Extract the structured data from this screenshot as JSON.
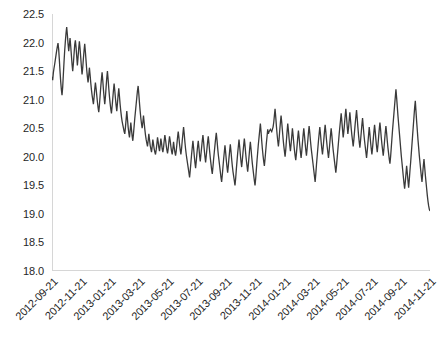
{
  "chart_data": {
    "type": "line",
    "title": "",
    "subtitle": "",
    "xlabel": "",
    "ylabel": "",
    "grid": false,
    "legend": false,
    "legend_position": "none",
    "line_color": "#3a3a3a",
    "axis_color": "#d6d6d6",
    "text_color": "#262626",
    "background": "#ffffff",
    "ylim": [
      18.0,
      22.5
    ],
    "y_ticks": [
      "18.0",
      "18.5",
      "19.0",
      "19.5",
      "20.0",
      "20.5",
      "21.0",
      "21.5",
      "22.0",
      "22.5"
    ],
    "y_tick_values": [
      18.0,
      18.5,
      19.0,
      19.5,
      20.0,
      20.5,
      21.0,
      21.5,
      22.0,
      22.5
    ],
    "x_tick_labels": [
      "2012-09-21",
      "2012-11-21",
      "2013-01-21",
      "2013-03-21",
      "2013-05-21",
      "2013-07-21",
      "2013-09-21",
      "2013-11-21",
      "2014-01-21",
      "2014-03-21",
      "2014-05-21",
      "2014-07-21",
      "2014-09-21",
      "2014-11-21"
    ],
    "x_range": [
      "2012-09-21",
      "2014-11-21"
    ],
    "series": [
      {
        "name": "series-1",
        "color": "#3a3a3a",
        "values": [
          21.4,
          21.34,
          21.47,
          21.55,
          21.62,
          21.7,
          21.78,
          21.86,
          21.93,
          21.99,
          21.88,
          21.7,
          21.5,
          21.32,
          21.18,
          21.08,
          21.22,
          21.44,
          21.66,
          21.86,
          22.02,
          22.16,
          22.27,
          22.14,
          21.98,
          21.85,
          21.96,
          22.08,
          21.94,
          21.78,
          21.62,
          21.5,
          21.63,
          21.8,
          21.96,
          22.04,
          21.92,
          21.76,
          21.6,
          21.74,
          21.9,
          22.02,
          21.9,
          21.74,
          21.58,
          21.44,
          21.56,
          21.72,
          21.86,
          21.98,
          21.84,
          21.68,
          21.52,
          21.4,
          21.3,
          21.42,
          21.56,
          21.44,
          21.3,
          21.18,
          21.08,
          21.0,
          20.92,
          21.04,
          21.18,
          21.3,
          21.2,
          21.08,
          20.96,
          20.86,
          20.78,
          20.9,
          21.06,
          21.22,
          21.36,
          21.48,
          21.34,
          21.18,
          21.04,
          20.92,
          21.05,
          21.22,
          21.38,
          21.5,
          21.36,
          21.2,
          21.06,
          20.94,
          20.84,
          20.76,
          20.88,
          21.02,
          21.16,
          21.28,
          21.16,
          21.02,
          20.9,
          20.8,
          20.94,
          21.08,
          21.2,
          21.06,
          20.92,
          20.8,
          20.7,
          20.62,
          20.56,
          20.5,
          20.44,
          20.4,
          20.52,
          20.66,
          20.8,
          20.66,
          20.52,
          20.42,
          20.34,
          20.46,
          20.6,
          20.48,
          20.36,
          20.28,
          20.4,
          20.54,
          20.68,
          20.8,
          20.92,
          21.04,
          21.16,
          21.24,
          21.1,
          20.94,
          20.8,
          20.68,
          20.58,
          20.5,
          20.6,
          20.72,
          20.6,
          20.48,
          20.38,
          20.3,
          20.24,
          20.18,
          20.28,
          20.4,
          20.3,
          20.2,
          20.14,
          20.08,
          20.18,
          20.3,
          20.22,
          20.14,
          20.08,
          20.04,
          20.12,
          20.22,
          20.34,
          20.26,
          20.16,
          20.1,
          20.2,
          20.32,
          20.24,
          20.14,
          20.08,
          20.16,
          20.28,
          20.38,
          20.3,
          20.2,
          20.12,
          20.06,
          20.14,
          20.26,
          20.36,
          20.28,
          20.18,
          20.1,
          20.04,
          20.14,
          20.26,
          20.16,
          20.08,
          20.02,
          20.1,
          20.22,
          20.34,
          20.44,
          20.34,
          20.22,
          20.12,
          20.04,
          20.14,
          20.28,
          20.4,
          20.52,
          20.4,
          20.26,
          20.14,
          20.04,
          19.96,
          19.88,
          19.8,
          19.72,
          19.64,
          19.76,
          19.9,
          20.04,
          20.16,
          20.28,
          20.16,
          20.02,
          19.9,
          19.8,
          19.92,
          20.06,
          20.18,
          20.28,
          20.16,
          20.02,
          19.92,
          20.04,
          20.16,
          20.28,
          20.38,
          20.26,
          20.12,
          20.0,
          19.9,
          20.02,
          20.14,
          20.26,
          20.36,
          20.24,
          20.1,
          19.98,
          19.88,
          19.78,
          19.7,
          19.82,
          19.96,
          20.08,
          20.2,
          20.32,
          20.42,
          20.3,
          20.16,
          20.04,
          19.94,
          19.84,
          19.74,
          19.64,
          19.56,
          19.68,
          19.82,
          19.96,
          20.08,
          20.2,
          20.08,
          19.94,
          19.82,
          19.72,
          19.84,
          19.98,
          20.1,
          20.22,
          20.1,
          19.96,
          19.84,
          19.74,
          19.66,
          19.58,
          19.5,
          19.62,
          19.78,
          19.92,
          20.06,
          20.18,
          20.3,
          20.18,
          20.04,
          19.92,
          19.82,
          19.94,
          20.08,
          20.2,
          20.32,
          20.2,
          20.06,
          19.94,
          19.84,
          19.74,
          19.86,
          20.0,
          20.14,
          20.26,
          20.14,
          20.0,
          19.88,
          19.78,
          19.68,
          19.58,
          19.5,
          19.62,
          19.78,
          19.94,
          20.08,
          20.22,
          20.34,
          20.46,
          20.58,
          20.44,
          20.28,
          20.14,
          20.02,
          19.92,
          19.84,
          19.96,
          20.1,
          20.24,
          20.36,
          20.48,
          20.4,
          20.44,
          20.46,
          20.48,
          20.46,
          20.44,
          20.48,
          20.52,
          20.6,
          20.72,
          20.84,
          20.7,
          20.54,
          20.4,
          20.28,
          20.18,
          20.3,
          20.46,
          20.6,
          20.72,
          20.6,
          20.46,
          20.32,
          20.2,
          20.1,
          20.0,
          20.12,
          20.28,
          20.44,
          20.58,
          20.46,
          20.32,
          20.2,
          20.1,
          20.22,
          20.36,
          20.5,
          20.38,
          20.24,
          20.12,
          20.02,
          19.94,
          20.06,
          20.2,
          20.34,
          20.46,
          20.34,
          20.2,
          20.08,
          19.98,
          20.1,
          20.24,
          20.38,
          20.5,
          20.38,
          20.24,
          20.12,
          20.02,
          20.14,
          20.28,
          20.42,
          20.54,
          20.42,
          20.28,
          20.16,
          20.06,
          19.96,
          19.86,
          19.76,
          19.66,
          19.56,
          19.7,
          19.86,
          20.0,
          20.14,
          20.28,
          20.4,
          20.52,
          20.4,
          20.26,
          20.14,
          20.04,
          20.16,
          20.3,
          20.44,
          20.56,
          20.44,
          20.3,
          20.18,
          20.08,
          19.98,
          20.1,
          20.24,
          20.38,
          20.5,
          20.38,
          20.24,
          20.12,
          20.02,
          19.92,
          19.82,
          19.72,
          19.84,
          19.98,
          20.12,
          20.26,
          20.4,
          20.52,
          20.64,
          20.76,
          20.62,
          20.48,
          20.34,
          20.44,
          20.58,
          20.72,
          20.84,
          20.7,
          20.54,
          20.4,
          20.5,
          20.64,
          20.78,
          20.64,
          20.5,
          20.38,
          20.28,
          20.18,
          20.3,
          20.44,
          20.58,
          20.7,
          20.82,
          20.68,
          20.52,
          20.38,
          20.26,
          20.16,
          20.28,
          20.42,
          20.56,
          20.68,
          20.54,
          20.4,
          20.28,
          20.18,
          20.08,
          19.98,
          20.1,
          20.24,
          20.38,
          20.52,
          20.4,
          20.26,
          20.14,
          20.04,
          20.16,
          20.3,
          20.44,
          20.56,
          20.44,
          20.3,
          20.18,
          20.08,
          20.2,
          20.34,
          20.48,
          20.6,
          20.48,
          20.34,
          20.22,
          20.12,
          20.02,
          20.14,
          20.28,
          20.42,
          20.54,
          20.42,
          20.28,
          20.16,
          20.06,
          19.96,
          19.88,
          20.0,
          20.16,
          20.32,
          20.48,
          20.62,
          20.76,
          20.9,
          21.04,
          21.18,
          21.04,
          20.88,
          20.72,
          20.58,
          20.44,
          20.3,
          20.16,
          20.02,
          19.9,
          19.78,
          19.66,
          19.54,
          19.44,
          19.56,
          19.7,
          19.84,
          19.72,
          19.58,
          19.46,
          19.6,
          19.76,
          19.9,
          20.06,
          20.22,
          20.38,
          20.54,
          20.7,
          20.86,
          20.98,
          20.8,
          20.62,
          20.46,
          20.3,
          20.16,
          20.02,
          19.9,
          19.78,
          19.66,
          19.56,
          19.7,
          19.84,
          19.96,
          19.82,
          19.68,
          19.56,
          19.44,
          19.32,
          19.22,
          19.14,
          19.08,
          19.05
        ]
      }
    ]
  }
}
